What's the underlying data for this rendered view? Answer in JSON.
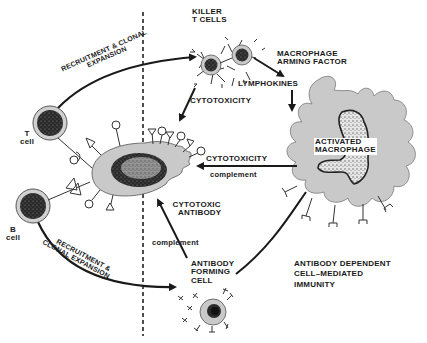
{
  "diagram": {
    "colors": {
      "cell_fill": "#c9c9c9",
      "nucleus": "#1f1f1f",
      "ink": "#1a1a1a",
      "background": "#ffffff",
      "divider": "#222222"
    },
    "labels": {
      "killer_t_cells_1": "KILLER",
      "killer_t_cells_2": "T CELLS",
      "macrophage_arming_1": "MACROPHAGE",
      "macrophage_arming_2": "ARMING FACTOR",
      "lymphokines": "LYMPHOKINES",
      "cytotoxicity_top": "CYTOTOXICITY",
      "cytotoxicity_mid": "CYTOTOXICITY",
      "complement_mid": "complement",
      "activated_1": "ACTIVATED",
      "activated_2": "MACROPHAGE",
      "cytotoxic_antibody_1": "CYTOTOXIC",
      "cytotoxic_antibody_2": "ANTIBODY",
      "complement_low": "complement",
      "antibody_forming_1": "ANTIBODY",
      "antibody_forming_2": "FORMING",
      "antibody_forming_3": "CELL",
      "adcc_1": "ANTIBODY DEPENDENT",
      "adcc_2": "CELL–MEDIATED",
      "adcc_3": "IMMUNITY",
      "t_cell_1": "T",
      "t_cell_2": "cell",
      "b_cell_1": "B",
      "b_cell_2": "cell",
      "recruit_top_1": "RECRUITMENT & CLONAL",
      "recruit_top_2": "EXPANSION",
      "recruit_bottom_1": "RECRUITMENT &",
      "recruit_bottom_2": "CLONAL EXPANSION"
    }
  }
}
